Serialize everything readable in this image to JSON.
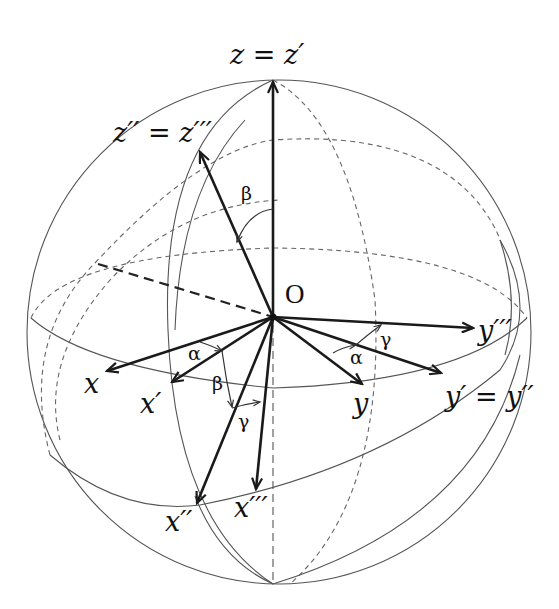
{
  "diagram": {
    "origin_label": "O",
    "axis_labels": {
      "z_zprime": "z = z′",
      "z2_z3": "z′′ = z′′′",
      "x": "x",
      "x1": "x′",
      "x2": "x′′",
      "x3": "x′′′",
      "y": "y",
      "y1_y2": "y′ = y′′",
      "y3": "y′′′"
    },
    "angle_labels": {
      "beta_top": "β",
      "alpha_left": "α",
      "beta_left": "β",
      "gamma_left": "γ",
      "alpha_right": "α",
      "gamma_right": "γ"
    },
    "colors": {
      "axis": "#1a1a1a",
      "circle": "#555555",
      "dashed": "#666666",
      "background": "#ffffff"
    }
  }
}
